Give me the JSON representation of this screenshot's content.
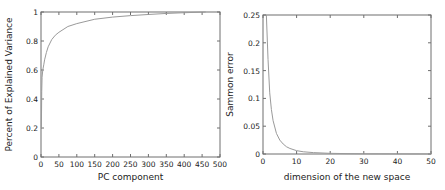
{
  "chart_data": [
    {
      "type": "line",
      "title": "",
      "xlabel": "PC component",
      "ylabel": "Percent of Explained Variance",
      "xlim": [
        0,
        500
      ],
      "ylim": [
        0,
        1
      ],
      "xticks": [
        0,
        50,
        100,
        150,
        200,
        250,
        300,
        350,
        400,
        450,
        500
      ],
      "yticks": [
        0,
        0.2,
        0.4,
        0.6,
        0.8,
        1
      ],
      "xtick_labels": [
        "0",
        "50",
        "100",
        "150",
        "200",
        "250",
        "300",
        "350",
        "400",
        "450",
        "500"
      ],
      "ytick_labels": [
        "0",
        "0.2",
        "0.4",
        "0.6",
        "0.8",
        "1"
      ],
      "grid": false,
      "series": [
        {
          "name": "explained variance",
          "color": "#9a9a9a",
          "x": [
            1,
            2,
            3,
            5,
            8,
            10,
            15,
            20,
            30,
            40,
            50,
            75,
            100,
            150,
            200,
            250,
            300,
            350,
            400,
            460
          ],
          "y": [
            0.2,
            0.45,
            0.55,
            0.6,
            0.64,
            0.67,
            0.72,
            0.76,
            0.81,
            0.84,
            0.86,
            0.9,
            0.92,
            0.95,
            0.965,
            0.975,
            0.983,
            0.99,
            0.995,
            1.0
          ]
        }
      ]
    },
    {
      "type": "line",
      "title": "",
      "xlabel": "dimension of the new space",
      "ylabel": "Sammon error",
      "xlim": [
        0,
        50
      ],
      "ylim": [
        0,
        0.25
      ],
      "xticks": [
        0,
        10,
        20,
        30,
        40,
        50
      ],
      "yticks": [
        0,
        0.05,
        0.1,
        0.15,
        0.2,
        0.25
      ],
      "xtick_labels": [
        "0",
        "10",
        "20",
        "30",
        "40",
        "50"
      ],
      "ytick_labels": [
        "0",
        "0.05",
        "0.1",
        "0.15",
        "0.2",
        "0.25"
      ],
      "grid": false,
      "series": [
        {
          "name": "sammon error",
          "color": "#9a9a9a",
          "x": [
            1,
            1.5,
            2,
            2.5,
            3,
            4,
            5,
            6,
            7,
            8,
            10,
            12,
            15,
            20,
            25,
            30,
            40,
            50
          ],
          "y": [
            0.25,
            0.17,
            0.11,
            0.08,
            0.06,
            0.037,
            0.025,
            0.018,
            0.013,
            0.01,
            0.006,
            0.004,
            0.0025,
            0.0012,
            0.0007,
            0.0004,
            0.0002,
            0.0001
          ]
        }
      ]
    }
  ]
}
